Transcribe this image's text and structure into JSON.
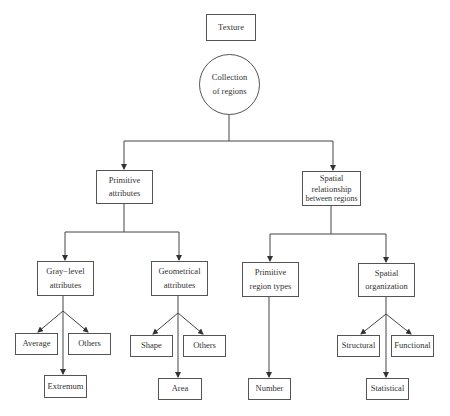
{
  "diagram": {
    "title": "Texture",
    "nodes": {
      "texture": {
        "label": "Texture"
      },
      "collection": {
        "line1": "Collection",
        "line2": "of regions"
      },
      "primitive_attributes": {
        "line1": "Primitive",
        "line2": "attributes"
      },
      "spatial_relationship": {
        "line1": "Spatial",
        "line2": "relationship",
        "line3": "between regions"
      },
      "gray_level": {
        "line1": "Gray−level",
        "line2": "attributes"
      },
      "geometrical": {
        "line1": "Geometrical",
        "line2": "attributes"
      },
      "primitive_region_types": {
        "line1": "Primitive",
        "line2": "region types"
      },
      "spatial_organization": {
        "line1": "Spatial",
        "line2": "organization"
      },
      "average": {
        "label": "Average"
      },
      "others_gray": {
        "label": "Others"
      },
      "extremum": {
        "label": "Extremum"
      },
      "shape": {
        "label": "Shape"
      },
      "others_geo": {
        "label": "Others"
      },
      "area": {
        "label": "Area"
      },
      "number": {
        "label": "Number"
      },
      "structural": {
        "label": "Structural"
      },
      "functional": {
        "label": "Functional"
      },
      "statistical": {
        "label": "Statistical"
      }
    },
    "edges": [
      [
        "Collection of regions",
        "Primitive attributes"
      ],
      [
        "Collection of regions",
        "Spatial relationship between regions"
      ],
      [
        "Primitive attributes",
        "Gray-level attributes"
      ],
      [
        "Primitive attributes",
        "Geometrical attributes"
      ],
      [
        "Spatial relationship between regions",
        "Primitive region types"
      ],
      [
        "Spatial relationship between regions",
        "Spatial organization"
      ],
      [
        "Gray-level attributes",
        "Average"
      ],
      [
        "Gray-level attributes",
        "Others"
      ],
      [
        "Gray-level attributes",
        "Extremum"
      ],
      [
        "Geometrical attributes",
        "Shape"
      ],
      [
        "Geometrical attributes",
        "Others"
      ],
      [
        "Geometrical attributes",
        "Area"
      ],
      [
        "Primitive region types",
        "Number"
      ],
      [
        "Spatial organization",
        "Structural"
      ],
      [
        "Spatial organization",
        "Functional"
      ],
      [
        "Spatial organization",
        "Statistical"
      ]
    ],
    "colors": {
      "line": "#444444",
      "border": "#555555",
      "background": "#ffffff"
    }
  }
}
